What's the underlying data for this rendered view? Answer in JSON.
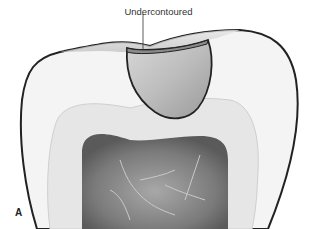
{
  "figure": {
    "callout_label": "Undercontoured",
    "panel_label": "A"
  }
}
